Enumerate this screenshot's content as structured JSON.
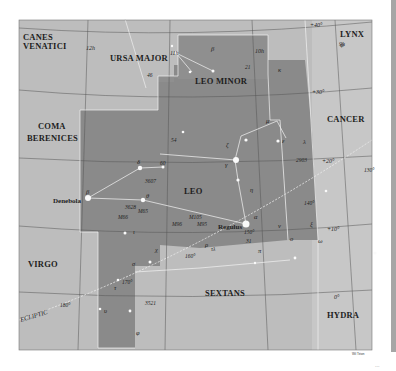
{
  "constellations": [
    {
      "name": "CANES",
      "name2": "VENATICI"
    },
    {
      "name": "URSA MAJOR"
    },
    {
      "name": "LEO MINOR"
    },
    {
      "name": "LYNX"
    },
    {
      "name": "COMA",
      "name2": "BERENICES"
    },
    {
      "name": "CANCER"
    },
    {
      "name": "LEO"
    },
    {
      "name": "VIRGO"
    },
    {
      "name": "SEXTANS"
    },
    {
      "name": "HYDRA"
    }
  ],
  "ra_labels": [
    "12h",
    "11h",
    "10h",
    "9h"
  ],
  "dec_labels": [
    "+40°",
    "+30°",
    "+20°",
    "+10°",
    "0°"
  ],
  "ecliptic": {
    "label": "ECLIPTIC",
    "longitudes": [
      "130°",
      "140°",
      "150°",
      "160°",
      "170°",
      "180°"
    ]
  },
  "named_stars": [
    "Denebola",
    "Regulus"
  ],
  "star_labels": {
    "leo_minor": [
      "β",
      "21",
      "46"
    ],
    "lynx": [
      "κ",
      "ψ"
    ],
    "leo": [
      "δ",
      "60",
      "β",
      "θ",
      "γ",
      "ζ",
      "μ",
      "ε",
      "λ",
      "η",
      "α",
      "ρ",
      "ι",
      "χ",
      "σ",
      "τ",
      "υ",
      "φ",
      "ν",
      "π",
      "ο",
      "ξ",
      "ω",
      "31",
      "54",
      "τλ"
    ],
    "deep_sky": [
      "3607",
      "3628",
      "M65",
      "M66",
      "M105",
      "M95",
      "M96",
      "2903",
      "3521"
    ]
  },
  "credit": "Wil Tirion",
  "page_number": "..."
}
